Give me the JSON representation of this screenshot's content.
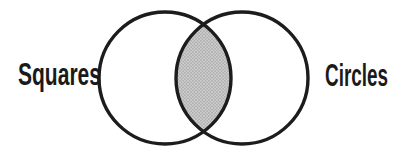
{
  "diagram": {
    "left_label": "Squares",
    "right_label": "Circles",
    "colors": {
      "background": "#ffffff",
      "outline": "#1c1c1c",
      "label_text": "#1a1a1a",
      "intersection_base": "#cecece",
      "intersection_dot": "#a3a3a3"
    }
  }
}
